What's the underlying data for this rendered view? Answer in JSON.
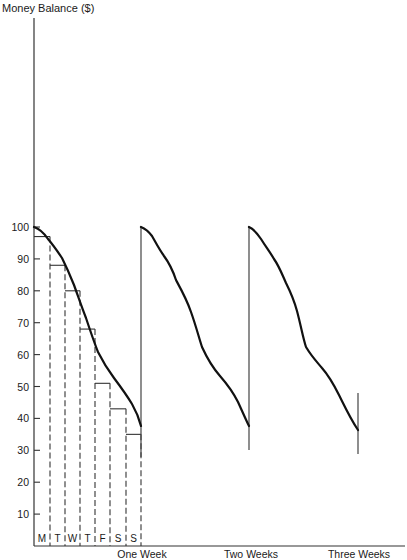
{
  "chart_data": {
    "type": "line",
    "title": "",
    "ylabel": "Money Balance ($)",
    "xlabel": "",
    "ylim": [
      0,
      100
    ],
    "yticks": [
      10,
      20,
      30,
      40,
      50,
      60,
      70,
      80,
      90,
      100
    ],
    "xtick_labels": [
      "One Week",
      "Two Weeks",
      "Three Weeks"
    ],
    "day_labels": [
      "M",
      "T",
      "W",
      "T",
      "F",
      "S",
      "S"
    ],
    "grid": false,
    "legend": null,
    "series": [
      {
        "name": "Money balance (sawtooth)",
        "style": "solid-thick",
        "x_weeks": [
          0,
          0.14,
          0.29,
          0.43,
          0.57,
          0.71,
          0.86,
          1.0,
          1.0,
          1.14,
          1.29,
          1.43,
          1.57,
          1.71,
          1.86,
          2.0,
          2.0,
          2.14,
          2.29,
          2.43,
          2.57,
          2.71,
          2.86,
          3.0,
          3.0
        ],
        "values": [
          100,
          94,
          85,
          72,
          57,
          47,
          38,
          30,
          100,
          91,
          80,
          65,
          52,
          44,
          35,
          30,
          100,
          91,
          79,
          63,
          52,
          44,
          37,
          29,
          48
        ]
      },
      {
        "name": "Daily average balance (step)",
        "style": "solid-thin with dashed day dividers",
        "categories": [
          "M",
          "T",
          "W",
          "T",
          "F",
          "S",
          "S"
        ],
        "values": [
          97,
          88,
          80,
          68,
          51,
          43,
          35
        ]
      }
    ],
    "annotations": [
      "Balance resets to 100 at the start of each week",
      "Final partial vertical line at Three Weeks rising to ~48"
    ]
  },
  "labels": {
    "y_axis_title": "Money Balance ($)",
    "y_ticks": [
      "10",
      "20",
      "30",
      "40",
      "50",
      "60",
      "70",
      "80",
      "90",
      "100"
    ],
    "days": [
      "M",
      "T",
      "W",
      "T",
      "F",
      "S",
      "S"
    ],
    "weeks": [
      "One Week",
      "Two Weeks",
      "Three Weeks"
    ]
  }
}
